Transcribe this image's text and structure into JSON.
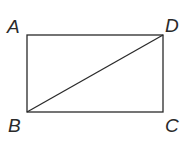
{
  "diagram": {
    "type": "rectangle-with-diagonal",
    "vertices": {
      "A": {
        "label": "A",
        "x": 27,
        "y": 35
      },
      "D": {
        "label": "D",
        "x": 163,
        "y": 35
      },
      "B": {
        "label": "B",
        "x": 27,
        "y": 112
      },
      "C": {
        "label": "C",
        "x": 163,
        "y": 112
      }
    },
    "edges": [
      "AD",
      "DC",
      "CB",
      "BA"
    ],
    "diagonal": "BD",
    "stroke_color": "#2a2a2a"
  }
}
